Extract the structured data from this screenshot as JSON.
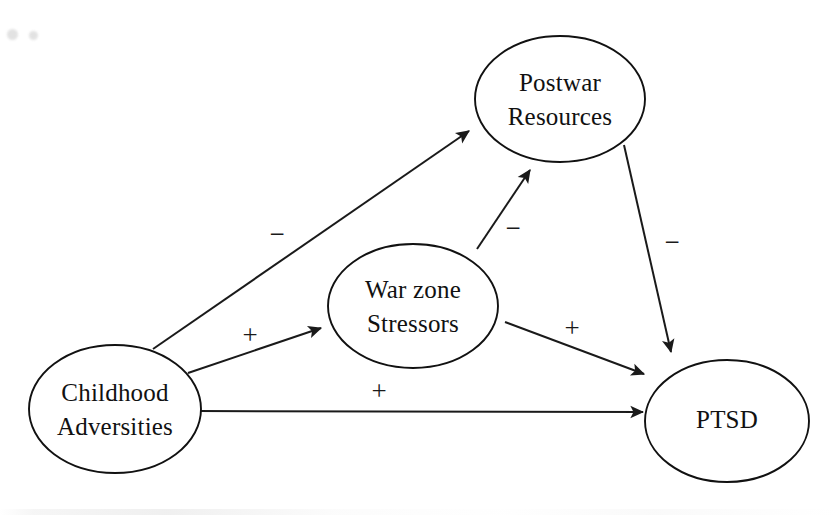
{
  "figure": {
    "type": "path-diagram",
    "title": "",
    "background_color": "#ffffff",
    "stroke_color": "#1a1a1a",
    "width": 837,
    "height": 515
  },
  "nodes": [
    {
      "id": "postwar-resources",
      "lines": [
        "Postwar",
        "Resources"
      ],
      "line1": "Postwar",
      "line2": "Resources",
      "cx": 560,
      "cy": 99,
      "rx": 85,
      "ry": 63
    },
    {
      "id": "war-zone-stressors",
      "lines": [
        "War zone",
        "Stressors"
      ],
      "line1": "War zone",
      "line2": "Stressors",
      "cx": 413,
      "cy": 306,
      "rx": 85,
      "ry": 62
    },
    {
      "id": "childhood-adversities",
      "lines": [
        "Childhood",
        "Adversities"
      ],
      "line1": "Childhood",
      "line2": "Adversities",
      "cx": 115,
      "cy": 409,
      "rx": 86,
      "ry": 64
    },
    {
      "id": "ptsd",
      "lines": [
        "PTSD"
      ],
      "line1": "PTSD",
      "line2": "",
      "cx": 727,
      "cy": 421,
      "rx": 82,
      "ry": 61
    }
  ],
  "edges": [
    {
      "id": "childhood-to-postwar",
      "from": "childhood-adversities",
      "to": "postwar-resources",
      "sign": "−",
      "sign_x": 277,
      "sign_y": 237,
      "x1": 153,
      "y1": 349,
      "x2": 469,
      "y2": 131
    },
    {
      "id": "warzone-to-postwar",
      "from": "war-zone-stressors",
      "to": "postwar-resources",
      "sign": "−",
      "sign_x": 513,
      "sign_y": 231,
      "x1": 477,
      "y1": 249,
      "x2": 530,
      "y2": 170
    },
    {
      "id": "postwar-to-ptsd",
      "from": "postwar-resources",
      "to": "ptsd",
      "sign": "−",
      "sign_x": 672,
      "sign_y": 245,
      "x1": 624,
      "y1": 145,
      "x2": 671,
      "y2": 352
    },
    {
      "id": "childhood-to-warzone",
      "from": "childhood-adversities",
      "to": "war-zone-stressors",
      "sign": "+",
      "sign_x": 250,
      "sign_y": 338,
      "x1": 188,
      "y1": 373,
      "x2": 321,
      "y2": 328
    },
    {
      "id": "warzone-to-ptsd",
      "from": "war-zone-stressors",
      "to": "ptsd",
      "sign": "+",
      "sign_x": 572,
      "sign_y": 331,
      "x1": 505,
      "y1": 322,
      "x2": 644,
      "y2": 374
    },
    {
      "id": "childhood-to-ptsd",
      "from": "childhood-adversities",
      "to": "ptsd",
      "sign": "+",
      "sign_x": 379,
      "sign_y": 394,
      "x1": 198,
      "y1": 411,
      "x2": 643,
      "y2": 412
    }
  ],
  "artifacts": {
    "specks": [
      {
        "x": 7,
        "y": 29,
        "size": 11
      },
      {
        "x": 29,
        "y": 31,
        "size": 9
      }
    ]
  }
}
